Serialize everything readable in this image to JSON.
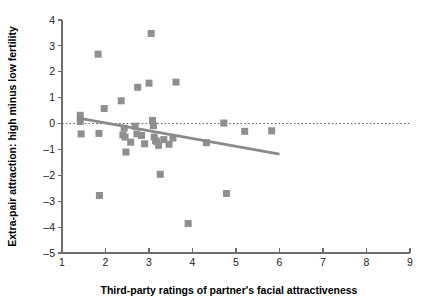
{
  "chart_data": {
    "type": "scatter",
    "title": "",
    "xlabel": "Third-party ratings of partner's facial attractiveness",
    "ylabel": "Extra-pair attraction: high minus low fertility",
    "xlim": [
      1,
      9
    ],
    "ylim": [
      -5,
      4
    ],
    "xticks": [
      1,
      2,
      3,
      4,
      5,
      6,
      7,
      8,
      9
    ],
    "xtick_labels": [
      "1",
      "2",
      "3",
      "4",
      "5",
      "6",
      "7",
      "8",
      "9"
    ],
    "yticks": [
      -5,
      -4,
      -3,
      -2,
      -1,
      0,
      1,
      2,
      3,
      4
    ],
    "ytick_labels": [
      "–5",
      "–4",
      "–3",
      "–2",
      "–1",
      "0",
      "1",
      "2",
      "3",
      "4"
    ],
    "grid": false,
    "legend": null,
    "marker_style": "filled-square",
    "marker_color": "#8f8f8f",
    "points": [
      {
        "x": 1.42,
        "y": 0.32
      },
      {
        "x": 1.42,
        "y": 0.08
      },
      {
        "x": 1.44,
        "y": -0.4
      },
      {
        "x": 1.83,
        "y": 2.68
      },
      {
        "x": 1.85,
        "y": -0.38
      },
      {
        "x": 1.86,
        "y": -2.78
      },
      {
        "x": 1.97,
        "y": 0.58
      },
      {
        "x": 2.36,
        "y": 0.88
      },
      {
        "x": 2.4,
        "y": -0.44
      },
      {
        "x": 2.43,
        "y": -0.18
      },
      {
        "x": 2.45,
        "y": -0.52
      },
      {
        "x": 2.47,
        "y": -1.1
      },
      {
        "x": 2.58,
        "y": -0.72
      },
      {
        "x": 2.68,
        "y": -0.1
      },
      {
        "x": 2.72,
        "y": -0.4
      },
      {
        "x": 2.74,
        "y": 1.4
      },
      {
        "x": 2.83,
        "y": -0.46
      },
      {
        "x": 2.9,
        "y": -0.78
      },
      {
        "x": 3.0,
        "y": 1.56
      },
      {
        "x": 3.05,
        "y": 3.48
      },
      {
        "x": 3.08,
        "y": 0.12
      },
      {
        "x": 3.1,
        "y": -0.08
      },
      {
        "x": 3.12,
        "y": -0.52
      },
      {
        "x": 3.15,
        "y": -0.66
      },
      {
        "x": 3.18,
        "y": -0.7
      },
      {
        "x": 3.22,
        "y": -0.84
      },
      {
        "x": 3.26,
        "y": -1.96
      },
      {
        "x": 3.34,
        "y": -0.62
      },
      {
        "x": 3.46,
        "y": -0.8
      },
      {
        "x": 3.55,
        "y": -0.56
      },
      {
        "x": 3.62,
        "y": 1.6
      },
      {
        "x": 3.9,
        "y": -3.86
      },
      {
        "x": 4.32,
        "y": -0.74
      },
      {
        "x": 4.72,
        "y": 0.02
      },
      {
        "x": 4.78,
        "y": -2.7
      },
      {
        "x": 5.2,
        "y": -0.3
      },
      {
        "x": 5.82,
        "y": -0.28
      }
    ],
    "reference_line": {
      "kind": "horizontal-dotted",
      "y": 0,
      "x_start": 1.0,
      "x_end": 9.0
    },
    "fit_line": {
      "kind": "linear-regression",
      "x_start": 1.35,
      "y_start": 0.22,
      "x_end": 6.0,
      "y_end": -1.18,
      "trend": "negative"
    }
  }
}
